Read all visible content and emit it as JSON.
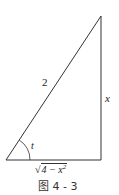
{
  "figure": {
    "caption": "图 4 - 3",
    "labels": {
      "hypotenuse": "2",
      "opposite": "x",
      "angle": "t",
      "adjacent_radical_sign": "√",
      "adjacent_radicand": "4 − x",
      "adjacent_exponent": "2"
    },
    "colors": {
      "line": "#333333",
      "background": "#ffffff"
    },
    "vertices": {
      "bottom_left": [
        6,
        160
      ],
      "bottom_right": [
        101,
        160
      ],
      "apex": [
        101,
        16
      ]
    }
  }
}
